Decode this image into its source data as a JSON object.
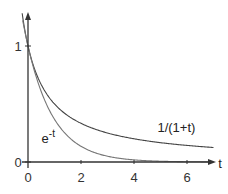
{
  "chart_data": {
    "type": "line",
    "title": "",
    "xlabel": "t",
    "ylabel": "",
    "xlim": [
      -0.25,
      7.2
    ],
    "ylim": [
      0,
      1.3
    ],
    "grid": false,
    "x_ticks": [
      0,
      2,
      4,
      6
    ],
    "x_tick_labels": [
      "0",
      "2",
      "4",
      "6"
    ],
    "y_ticks": [
      0,
      1
    ],
    "y_tick_labels": [
      "0",
      "1"
    ],
    "series": [
      {
        "name": "1/(1+t)",
        "function": "1/(1+t)",
        "x": [
          -0.22,
          0,
          0.5,
          1,
          2,
          3,
          4,
          5,
          6,
          7
        ],
        "values": [
          1.28,
          1.0,
          0.667,
          0.5,
          0.333,
          0.25,
          0.2,
          0.167,
          0.143,
          0.125
        ],
        "color": "#444444",
        "style": "solid"
      },
      {
        "name": "e^-t",
        "function": "exp(-t)",
        "x": [
          -0.2,
          0,
          0.5,
          1,
          2,
          3,
          4,
          5,
          6,
          7
        ],
        "values": [
          1.221,
          1.0,
          0.607,
          0.368,
          0.135,
          0.05,
          0.018,
          0.007,
          0.002,
          0.001
        ],
        "color": "#777777",
        "style": "solid"
      }
    ],
    "annotations": [
      {
        "text": "1/(1+t)",
        "series": "1/(1+t)",
        "at": [
          5.6,
          0.26
        ]
      },
      {
        "text_base": "e",
        "text_sup": "-t",
        "series": "e^-t",
        "at": [
          0.55,
          0.2
        ]
      }
    ]
  }
}
